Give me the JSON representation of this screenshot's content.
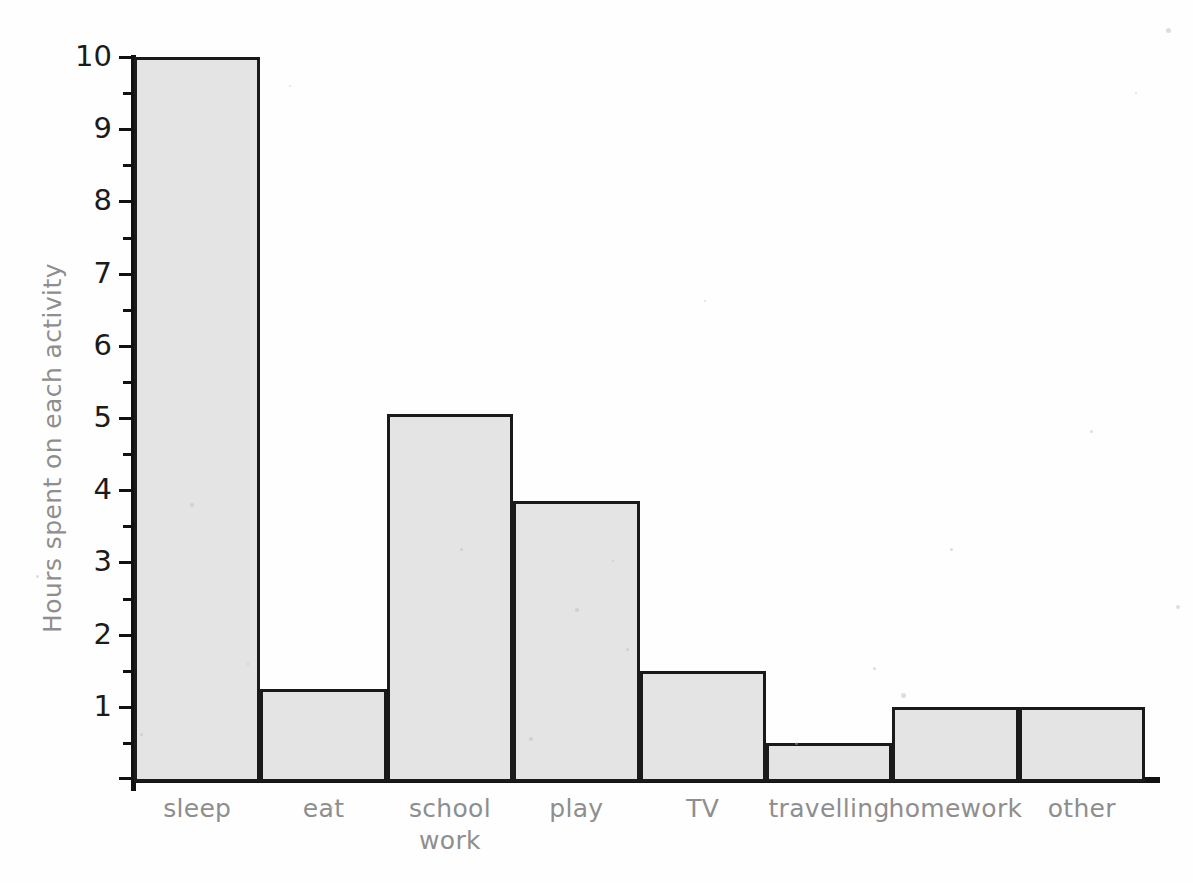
{
  "chart_data": {
    "type": "bar",
    "title": "",
    "xlabel": "",
    "ylabel": "Hours spent on each activity",
    "categories": [
      "sleep",
      "eat",
      "school work",
      "play",
      "TV",
      "travelling",
      "homework",
      "other"
    ],
    "values": [
      10,
      1.25,
      5.05,
      3.85,
      1.5,
      0.5,
      1.0,
      1.0
    ],
    "ylim": [
      0,
      10
    ],
    "ytick_labels": [
      "1",
      "2",
      "3",
      "4",
      "5",
      "6",
      "7",
      "8",
      "9",
      "10"
    ],
    "ytick_values": [
      1,
      2,
      3,
      4,
      5,
      6,
      7,
      8,
      9,
      10
    ],
    "yminor_step": 0.5,
    "grid": false,
    "legend": null,
    "bar_gap": 0,
    "colors": {
      "bar_fill": "#e4e4e4",
      "bar_outline": "#1a1a1a",
      "axis": "#111111",
      "tick_text": "#1b1b1b",
      "label_text": "#8e8e8e",
      "background": "#fefefe"
    }
  },
  "axes": {
    "y_title": "Hours spent on each activity",
    "ticks": [
      {
        "label": "10",
        "value": 10
      },
      {
        "label": "9",
        "value": 9
      },
      {
        "label": "8",
        "value": 8
      },
      {
        "label": "7",
        "value": 7
      },
      {
        "label": "6",
        "value": 6
      },
      {
        "label": "5",
        "value": 5
      },
      {
        "label": "4",
        "value": 4
      },
      {
        "label": "3",
        "value": 3
      },
      {
        "label": "2",
        "value": 2
      },
      {
        "label": "1",
        "value": 1
      }
    ]
  },
  "bars": [
    {
      "label": "sleep",
      "label_line2": "",
      "value": 10
    },
    {
      "label": "eat",
      "label_line2": "",
      "value": 1.25
    },
    {
      "label": "school",
      "label_line2": "work",
      "value": 5.05
    },
    {
      "label": "play",
      "label_line2": "",
      "value": 3.85
    },
    {
      "label": "TV",
      "label_line2": "",
      "value": 1.5
    },
    {
      "label": "travelling",
      "label_line2": "",
      "value": 0.5
    },
    {
      "label": "homework",
      "label_line2": "",
      "value": 1.0
    },
    {
      "label": "other",
      "label_line2": "",
      "value": 1.0
    }
  ]
}
